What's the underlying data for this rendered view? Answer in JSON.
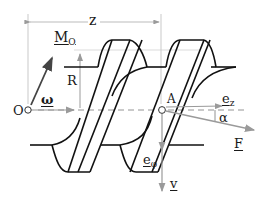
{
  "diagram": {
    "labels": {
      "z": "z",
      "moment": {
        "main": "M",
        "sub": "O"
      },
      "radius": "R",
      "omega": "ω",
      "origin": "O",
      "point_a": "A",
      "e_z": {
        "main": "e",
        "sub": "z"
      },
      "alpha": "α",
      "force": "F",
      "e_phi": {
        "main": "e",
        "sub": "φ"
      },
      "velocity": "v"
    },
    "colors": {
      "line": "#111111",
      "gray": "#9a9a9a",
      "vector_dark": "#444444"
    }
  }
}
